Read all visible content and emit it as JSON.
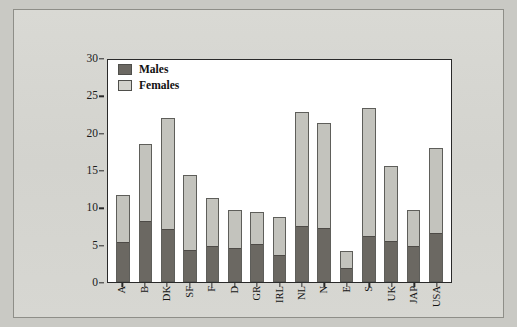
{
  "chart_data": {
    "type": "bar",
    "subtype": "stacked",
    "title": "",
    "xlabel": "",
    "ylabel": "",
    "ylim": [
      0,
      30
    ],
    "yticks": [
      0,
      5,
      10,
      15,
      20,
      25,
      30
    ],
    "grid": false,
    "legend_position": "top-left",
    "categories": [
      "A",
      "B",
      "DK",
      "SF",
      "F",
      "D",
      "GR",
      "IRL",
      "NL",
      "N",
      "E",
      "S",
      "UK",
      "JAP",
      "USA"
    ],
    "series": [
      {
        "name": "Males",
        "color": "#6b6862",
        "values": [
          5.3,
          8.1,
          7.0,
          4.2,
          4.7,
          4.5,
          5.1,
          3.5,
          7.3,
          7.1,
          1.8,
          6.0,
          5.3,
          4.7,
          6.4
        ]
      },
      {
        "name": "Females",
        "color": "#c3c3bd",
        "values": [
          6.3,
          10.4,
          15.0,
          10.1,
          6.5,
          5.1,
          4.3,
          5.2,
          15.5,
          14.2,
          2.4,
          17.3,
          10.2,
          5.0,
          11.6
        ]
      }
    ],
    "totals": [
      11.6,
      18.5,
      22.0,
      14.3,
      11.2,
      9.6,
      9.4,
      8.7,
      22.8,
      21.3,
      4.2,
      23.3,
      15.5,
      9.7,
      18.0
    ]
  },
  "legend": {
    "items": [
      {
        "label": "Males",
        "swatch": "males"
      },
      {
        "label": "Females",
        "swatch": "females"
      }
    ]
  },
  "colors": {
    "page_background": "#c9c9c4",
    "card_background": "#d6d6d1",
    "plot_background": "#ffffff",
    "axis": "#2a2a2a",
    "males": "#6b6862",
    "females": "#c3c3bd"
  }
}
